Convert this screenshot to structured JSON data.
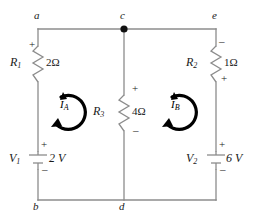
{
  "figure": {
    "type": "circuit-schematic",
    "background_color": "#ffffff",
    "wire_color": "#8c8c8c",
    "component_color": "#8c8c8c",
    "label_color": "#1a1a1a",
    "mesh_arrow_color": "#000000"
  },
  "nodes": [
    {
      "id": "a",
      "label": "a",
      "position": "top-left"
    },
    {
      "id": "c",
      "label": "c",
      "position": "top-center",
      "junction_dot": true
    },
    {
      "id": "e",
      "label": "e",
      "position": "top-right"
    },
    {
      "id": "b",
      "label": "b",
      "position": "bottom-left"
    },
    {
      "id": "d",
      "label": "d",
      "position": "bottom-center"
    }
  ],
  "resistors": [
    {
      "id": "R1",
      "name": "R",
      "subscript": "1",
      "value": "2Ω",
      "resistance_ohms": 2,
      "branch": "a-b (left)",
      "polarity_top": "+",
      "polarity_bottom": ""
    },
    {
      "id": "R3",
      "name": "R",
      "subscript": "3",
      "value": "4Ω",
      "resistance_ohms": 4,
      "branch": "c-d (middle)",
      "polarity_top": "+",
      "polarity_bottom": "–"
    },
    {
      "id": "R2",
      "name": "R",
      "subscript": "2",
      "value": "1Ω",
      "resistance_ohms": 1,
      "branch": "e-right (right)",
      "polarity_top": "–",
      "polarity_bottom": "+"
    }
  ],
  "sources": [
    {
      "id": "V1",
      "name": "V",
      "subscript": "1",
      "value": "2 V",
      "volts": 2,
      "branch": "left rail",
      "polarity_top": "+",
      "polarity_bottom": "–"
    },
    {
      "id": "V2",
      "name": "V",
      "subscript": "2",
      "value": "6 V",
      "volts": 6,
      "branch": "right rail",
      "polarity_top": "+",
      "polarity_bottom": "–"
    }
  ],
  "meshes": [
    {
      "id": "IA",
      "name": "I",
      "subscript": "A",
      "direction": "counterclockwise",
      "position": "left loop"
    },
    {
      "id": "IB",
      "name": "I",
      "subscript": "B",
      "direction": "counterclockwise",
      "position": "right loop"
    }
  ]
}
